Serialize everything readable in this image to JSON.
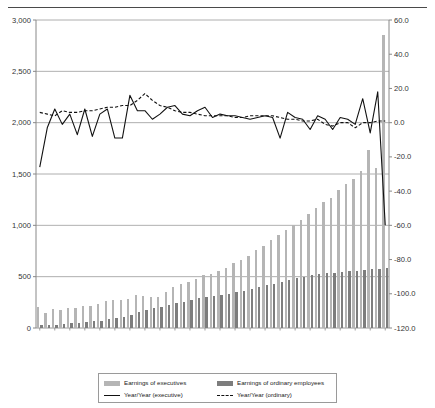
{
  "title": "",
  "legend": {
    "items": [
      {
        "key": "exec_bar",
        "label": "Earnings of executives",
        "marker": "bar-light"
      },
      {
        "key": "ord_bar",
        "label": "Earnings of ordinary employees",
        "marker": "bar-dark"
      },
      {
        "key": "exec_line",
        "label": "Year/Year (executive)",
        "marker": "line-solid"
      },
      {
        "key": "ord_line",
        "label": "Year/Year (ordinary)",
        "marker": "line-dash"
      }
    ]
  },
  "colors": {
    "bar_executives": "#b5b5b5",
    "bar_ordinary": "#7d7d7d",
    "line_executive": "#111111",
    "line_ordinary": "#111111",
    "gridline": "#9a9a9a",
    "axis": "#888888",
    "text": "#333333"
  },
  "chart_data": {
    "type": "bar",
    "title": "",
    "xlabel": "",
    "ylabel": "",
    "y2label": "",
    "grid": true,
    "legend_position": "bottom",
    "ylim": [
      0,
      3000
    ],
    "yticks": [
      "0",
      "500",
      "1,000",
      "1,500",
      "2,000",
      "2,500",
      "3,000"
    ],
    "ytick_values": [
      0,
      500,
      1000,
      1500,
      2000,
      2500,
      3000
    ],
    "y2lim": [
      -120.0,
      60.0
    ],
    "y2ticks": [
      "-120.0",
      "-100.0",
      "-80.0",
      "-60.0",
      "-40.0",
      "-20.0",
      "0.0",
      "20.0",
      "40.0",
      "60.0"
    ],
    "y2tick_values": [
      -120,
      -100,
      -80,
      -60,
      -40,
      -20,
      0,
      20,
      40,
      60
    ],
    "x": [
      1960,
      1961,
      1962,
      1963,
      1964,
      1965,
      1966,
      1967,
      1968,
      1969,
      1970,
      1971,
      1972,
      1973,
      1974,
      1975,
      1976,
      1977,
      1978,
      1979,
      1980,
      1981,
      1982,
      1983,
      1984,
      1985,
      1986,
      1987,
      1988,
      1989,
      1990,
      1991,
      1992,
      1993,
      1994,
      1995,
      1996,
      1997,
      1998,
      1999,
      2000,
      2001,
      2002,
      2003,
      2004,
      2005,
      2006
    ],
    "xtick_labels": [
      "1960",
      "1962",
      "1964",
      "1966",
      "1968",
      "1970",
      "1972",
      "1974",
      "1976",
      "1978",
      "1980",
      "1982",
      "1984",
      "1986",
      "1988",
      "1990",
      "1992",
      "1994",
      "1996",
      "1998",
      "2000",
      "2002",
      "2004",
      "2006"
    ],
    "series": [
      {
        "name": "Earnings of executives",
        "axis": "left",
        "kind": "bar",
        "color": "#b5b5b5",
        "values": [
          205,
          150,
          185,
          180,
          190,
          195,
          215,
          215,
          230,
          260,
          275,
          270,
          285,
          320,
          310,
          305,
          300,
          355,
          400,
          430,
          450,
          480,
          515,
          530,
          555,
          580,
          630,
          660,
          700,
          755,
          800,
          860,
          905,
          950,
          1000,
          1050,
          1110,
          1170,
          1230,
          1270,
          1340,
          1400,
          1450,
          1530,
          1730,
          1560,
          2850
        ]
      },
      {
        "name": "Earnings of ordinary employees",
        "axis": "left",
        "kind": "bar",
        "color": "#7d7d7d",
        "values": [
          25,
          28,
          33,
          38,
          44,
          50,
          58,
          65,
          73,
          84,
          97,
          112,
          130,
          152,
          175,
          192,
          208,
          224,
          240,
          256,
          272,
          288,
          300,
          312,
          324,
          336,
          350,
          364,
          380,
          396,
          414,
          432,
          450,
          468,
          486,
          500,
          512,
          524,
          534,
          540,
          548,
          554,
          558,
          564,
          572,
          578,
          582
        ]
      },
      {
        "name": "Year/Year (executive)",
        "axis": "right",
        "kind": "line",
        "style": "solid",
        "color": "#111111",
        "values": [
          -26.0,
          -3.0,
          8.0,
          -1.0,
          5.0,
          -7.0,
          8.0,
          -8.0,
          5.0,
          8.0,
          -9.0,
          -9.0,
          16.0,
          7.0,
          7.0,
          2.0,
          5.0,
          9.0,
          10.0,
          5.0,
          4.0,
          7.0,
          9.0,
          3.0,
          5.0,
          4.0,
          4.0,
          3.0,
          2.0,
          3.0,
          4.0,
          3.0,
          -9.0,
          6.0,
          3.0,
          2.0,
          -4.0,
          4.0,
          2.0,
          -4.0,
          3.0,
          2.0,
          -1.0,
          14.0,
          -6.0,
          18.0,
          -60.0
        ]
      },
      {
        "name": "Year/Year (ordinary)",
        "axis": "right",
        "kind": "line",
        "style": "dashed",
        "color": "#111111",
        "values": [
          6.0,
          5.0,
          4.0,
          7.0,
          6.0,
          6.0,
          7.0,
          7.0,
          8.0,
          9.0,
          9.0,
          10.0,
          10.0,
          13.0,
          17.0,
          13.0,
          10.0,
          9.0,
          7.0,
          6.0,
          6.0,
          5.0,
          4.0,
          4.0,
          4.0,
          4.0,
          3.0,
          3.0,
          4.0,
          4.0,
          4.0,
          4.0,
          3.0,
          2.0,
          2.0,
          1.0,
          1.0,
          2.0,
          -1.0,
          -2.0,
          0.0,
          0.0,
          -3.0,
          0.0,
          0.0,
          1.0,
          1.0
        ]
      }
    ]
  }
}
